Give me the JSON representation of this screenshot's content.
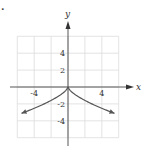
{
  "chart_data": {
    "type": "line",
    "title": "",
    "xlabel": "x",
    "ylabel": "y",
    "xlim": [
      -6,
      6
    ],
    "ylim": [
      -6,
      6
    ],
    "grid": true,
    "grid_step": 2,
    "x_ticks": [
      {
        "value": -4,
        "label": "-4"
      },
      {
        "value": 4,
        "label": "4"
      }
    ],
    "y_ticks": [
      {
        "value": 4,
        "label": "4"
      },
      {
        "value": 2,
        "label": "2"
      },
      {
        "value": -2,
        "label": "-2"
      },
      {
        "value": -4,
        "label": "-4"
      }
    ],
    "series": [
      {
        "name": "curve",
        "description": "cusp at origin, both branches decreasing away from origin with arrows",
        "x": [
          -5.5,
          -4,
          -3,
          -2,
          -1,
          0,
          1,
          2,
          3,
          4,
          5.5
        ],
        "y": [
          -3.1,
          -2.5,
          -2.1,
          -1.6,
          -1.0,
          0,
          -1.0,
          -1.6,
          -2.1,
          -2.5,
          -3.1
        ],
        "color": "#555555",
        "arrows": "both"
      }
    ]
  },
  "labels": {
    "x_axis": "x",
    "y_axis": "y",
    "marker": "."
  }
}
